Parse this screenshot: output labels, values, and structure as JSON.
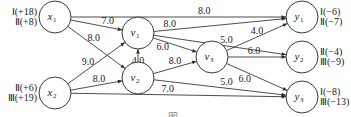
{
  "diagram": {
    "type": "directed-network",
    "nodes": [
      {
        "id": "x1",
        "label": "x",
        "sub": "1",
        "cx": 55,
        "cy": 17,
        "annotations": [
          "Ⅰ(+18)",
          "Ⅱ(+8)"
        ],
        "ann_side": "left"
      },
      {
        "id": "x2",
        "label": "x",
        "sub": "2",
        "cx": 55,
        "cy": 93,
        "annotations": [
          "Ⅱ(+6)",
          "Ⅲ(+19)"
        ],
        "ann_side": "left"
      },
      {
        "id": "v1",
        "label": "v",
        "sub": "1",
        "cx": 138,
        "cy": 33,
        "annotations": []
      },
      {
        "id": "v2",
        "label": "v",
        "sub": "2",
        "cx": 138,
        "cy": 78,
        "annotations": []
      },
      {
        "id": "v3",
        "label": "v",
        "sub": "3",
        "cx": 212,
        "cy": 57,
        "annotations": []
      },
      {
        "id": "y1",
        "label": "y",
        "sub": "1",
        "cx": 302,
        "cy": 17,
        "annotations": [
          "Ⅰ(−6)",
          "Ⅱ(−7)"
        ],
        "ann_side": "right"
      },
      {
        "id": "y2",
        "label": "y",
        "sub": "2",
        "cx": 302,
        "cy": 57,
        "annotations": [
          "Ⅱ(−4)",
          "Ⅲ(−9)"
        ],
        "ann_side": "right"
      },
      {
        "id": "y3",
        "label": "y",
        "sub": "3",
        "cx": 302,
        "cy": 97,
        "annotations": [
          "Ⅰ(−8)",
          "Ⅲ(−13)"
        ],
        "ann_side": "right"
      }
    ],
    "edges": [
      {
        "from": "x1",
        "to": "y1",
        "weight": "8.0"
      },
      {
        "from": "x1",
        "to": "v1",
        "weight": "7.0"
      },
      {
        "from": "x1",
        "to": "v2",
        "weight": "8.0"
      },
      {
        "from": "x2",
        "to": "v1",
        "weight": "9.0"
      },
      {
        "from": "x2",
        "to": "v2",
        "weight": "8.0"
      },
      {
        "from": "x2",
        "to": "y3",
        "weight": "7.0"
      },
      {
        "from": "v2",
        "to": "v1",
        "weight": "4.0"
      },
      {
        "from": "v1",
        "to": "y1",
        "weight": "8.0"
      },
      {
        "from": "v1",
        "to": "v3",
        "weight": "6.0"
      },
      {
        "from": "v1",
        "to": "y2",
        "weight": "5.0"
      },
      {
        "from": "v2",
        "to": "v3",
        "weight": "8.0"
      },
      {
        "from": "v2",
        "to": "y3",
        "weight": "5.0"
      },
      {
        "from": "v3",
        "to": "y1",
        "weight": "4.0"
      },
      {
        "from": "v3",
        "to": "y2",
        "weight": "6.0"
      },
      {
        "from": "v3",
        "to": "y3",
        "weight": "6.0"
      }
    ],
    "caption": "图"
  }
}
